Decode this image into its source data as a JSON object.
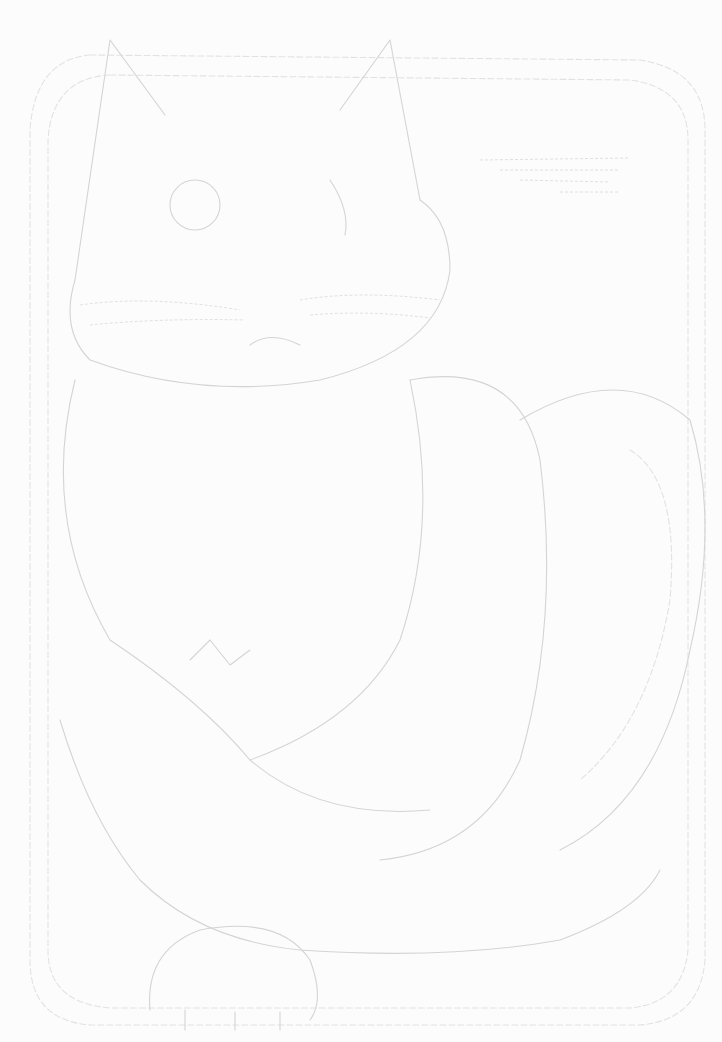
{
  "artwork": {
    "subject": "cat",
    "style": "faint pencil line sketch",
    "frame": "double rounded rectangle border",
    "background_color": "#fcfcfc",
    "line_color": "#d4d4d4"
  }
}
